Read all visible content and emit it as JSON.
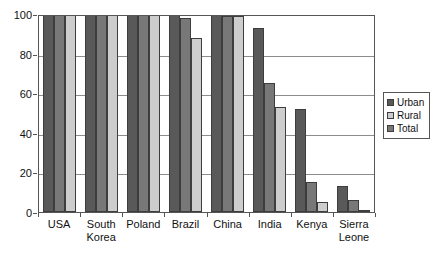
{
  "chart_data": {
    "type": "bar",
    "title": "",
    "subtitle": "",
    "xlabel": "",
    "ylabel": "",
    "ylim": [
      0,
      100
    ],
    "yticks": [
      0,
      20,
      40,
      60,
      80,
      100
    ],
    "ytick_labels": [
      "0",
      "20",
      "40",
      "60",
      "80",
      "100"
    ],
    "grid": true,
    "grid_axis": "y",
    "legend_position": "right",
    "categories": [
      "USA",
      "South\nKorea",
      "Poland",
      "Brazil",
      "China",
      "India",
      "Kenya",
      "Sierra\nLeone"
    ],
    "series": [
      {
        "name": "Urban",
        "color": "#595959",
        "values": [
          100,
          100,
          100,
          100,
          100,
          93,
          52,
          13
        ]
      },
      {
        "name": "Total",
        "color": "#787878",
        "values": [
          100,
          100,
          100,
          98,
          99,
          65,
          15,
          6
        ]
      },
      {
        "name": "Rural",
        "color": "#cdcdcd",
        "values": [
          100,
          100,
          100,
          88,
          99,
          53,
          5,
          1
        ]
      }
    ],
    "bar_order_in_group": [
      "Urban",
      "Total",
      "Rural"
    ]
  },
  "legend": {
    "items": [
      {
        "label": "Urban",
        "swatch": "urban"
      },
      {
        "label": "Rural",
        "swatch": "rural"
      },
      {
        "label": "Total",
        "swatch": "total"
      }
    ]
  },
  "colors": {
    "urban": "#595959",
    "total": "#787878",
    "rural": "#cdcdcd",
    "axis": "#555555",
    "grid": "#8c8c8c",
    "text": "#111111",
    "background": "#ffffff"
  }
}
